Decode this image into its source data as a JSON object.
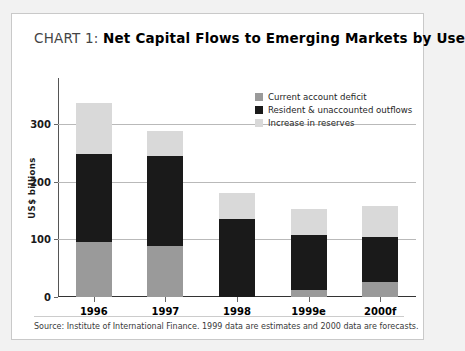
{
  "title": {
    "prefix": "CHART 1:",
    "main": "Net Capital Flows to Emerging Markets by Use"
  },
  "source_note": "Source: Institute of International Finance. 1999 data are estimates and 2000 data are forecasts.",
  "colors": {
    "current_account_deficit": "#9a9a9a",
    "resident_outflows": "#1a1a1a",
    "increase_in_reserves": "#d9d9d9",
    "page_background": "#f2f2f2",
    "card_background": "#ffffff",
    "gridline": "#b9b9b9",
    "axis": "#555555"
  },
  "chart_data": {
    "type": "bar",
    "stacked": true,
    "title": "CHART 1: Net Capital Flows to Emerging Markets by Use",
    "xlabel": "",
    "ylabel": "US$ billions",
    "categories": [
      "1996",
      "1997",
      "1998",
      "1999e",
      "2000f"
    ],
    "series": [
      {
        "name": "Current account deficit",
        "color": "#9a9a9a",
        "values": [
          96,
          88,
          0,
          13,
          26
        ]
      },
      {
        "name": "Resident & unaccounted outflows",
        "color": "#1a1a1a",
        "values": [
          152,
          156,
          136,
          95,
          79
        ]
      },
      {
        "name": "Increase in reserves",
        "color": "#d9d9d9",
        "values": [
          89,
          44,
          44,
          44,
          53
        ]
      }
    ],
    "totals": [
      337,
      288,
      180,
      152,
      158
    ],
    "ylim": [
      0,
      380
    ],
    "yticks": [
      0,
      100,
      200,
      300
    ],
    "ytick_labels": [
      "0",
      "100",
      "200",
      "300"
    ],
    "grid": true,
    "legend_position": "top-right"
  }
}
